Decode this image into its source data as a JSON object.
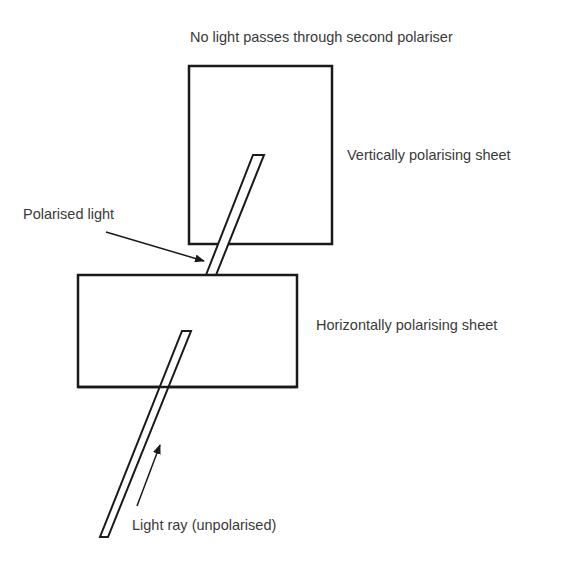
{
  "diagram": {
    "type": "physics-polarisation",
    "labels": {
      "top": "No light passes through second polariser",
      "vertical_sheet": "Vertically polarising sheet",
      "polarised_light": "Polarised light",
      "horizontal_sheet": "Horizontally polarising sheet",
      "light_ray": "Light ray (unpolarised)"
    },
    "colors": {
      "stroke": "#1a1a1a",
      "text": "#3a3a3a",
      "background": "#ffffff"
    }
  }
}
